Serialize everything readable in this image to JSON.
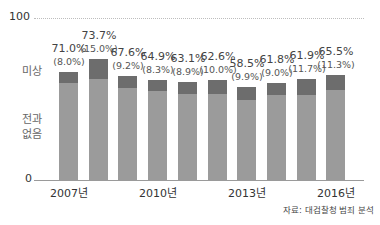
{
  "chart_data": {
    "type": "bar",
    "stacked": true,
    "title": "",
    "xlabel": "",
    "ylabel": "",
    "ylim": [
      0,
      100
    ],
    "yticks": [
      "0",
      "100"
    ],
    "y_annotations": [
      "미상",
      "전과 없음"
    ],
    "categories": [
      "2007",
      "2008",
      "2009",
      "2010",
      "2011",
      "2012",
      "2013",
      "2014",
      "2015",
      "2016"
    ],
    "xtick_labels": [
      {
        "index": 0,
        "label": "2007년"
      },
      {
        "index": 3,
        "label": "2010년"
      },
      {
        "index": 6,
        "label": "2013년"
      },
      {
        "index": 9,
        "label": "2016년"
      }
    ],
    "series": [
      {
        "name": "전과 없음",
        "color": "#9b9b9b",
        "values": [
          71.0,
          73.7,
          67.6,
          64.9,
          63.1,
          62.6,
          58.5,
          61.8,
          61.9,
          65.5
        ]
      },
      {
        "name": "미상",
        "color": "#6d6d6d",
        "values": [
          8.0,
          15.0,
          9.2,
          8.3,
          8.9,
          10.0,
          9.9,
          9.0,
          11.7,
          11.3
        ]
      }
    ],
    "data_labels": [
      {
        "main": "71.0%",
        "sub": "(8.0%)"
      },
      {
        "main": "73.7%",
        "sub": "(15.0%)"
      },
      {
        "main": "67.6%",
        "sub": "(9.2%)"
      },
      {
        "main": "64.9%",
        "sub": "(8.3%)"
      },
      {
        "main": "63.1%",
        "sub": "(8.9%)"
      },
      {
        "main": "62.6%",
        "sub": "(10.0%)"
      },
      {
        "main": "58.5%",
        "sub": "(9.9%)"
      },
      {
        "main": "61.8%",
        "sub": "(9.0%)"
      },
      {
        "main": "61.9%",
        "sub": "(11.7%)"
      },
      {
        "main": "65.5%",
        "sub": "(11.3%)"
      }
    ],
    "grid": false,
    "legend": "inline-left",
    "source": "자료: 대검찰청 범죄 분석"
  },
  "labels": {
    "y_top": "100",
    "y_zero": "0",
    "unknown": "미상",
    "no_record_1": "전과",
    "no_record_2": "없음",
    "source": "자료: 대검찰청 범죄 분석"
  }
}
